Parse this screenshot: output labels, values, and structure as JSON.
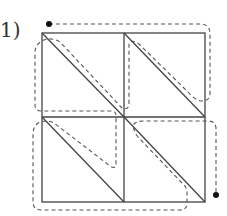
{
  "figure": {
    "label": "1)",
    "grid": {
      "rows": 2,
      "cols": 2,
      "diagonal": "top-left to bottom-right"
    },
    "path": {
      "style": "dashed",
      "start": "top-left dot",
      "end": "bottom-right dot"
    },
    "colors": {
      "line": "#444444",
      "dash": "#555555",
      "dot": "#111111"
    }
  }
}
